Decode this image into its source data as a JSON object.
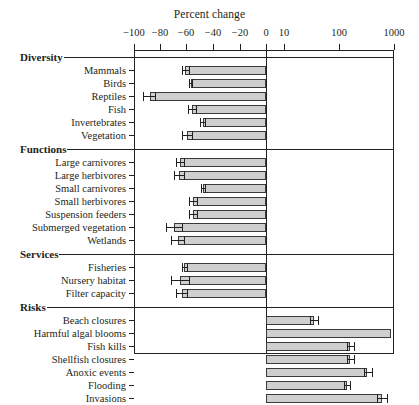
{
  "chart_data": {
    "type": "bar",
    "title": "Percent change",
    "xlabel": "Percent change",
    "ylabel": "",
    "orientation": "horizontal",
    "grid": false,
    "legend": null,
    "axis_note": "Asymmetric x-axis: linear from -100 to 0, logarithmic from 10 to 1000",
    "xticks": [
      {
        "label": "−100",
        "value": -100,
        "px": 134
      },
      {
        "label": "−80",
        "value": -80,
        "px": 160
      },
      {
        "label": "−60",
        "value": -60,
        "px": 186
      },
      {
        "label": "−40",
        "value": -40,
        "px": 213
      },
      {
        "label": "−20",
        "value": -20,
        "px": 240
      },
      {
        "label": "0",
        "value": 0,
        "px": 266
      },
      {
        "label": "10",
        "value": 10,
        "px": 284
      },
      {
        "label": "100",
        "value": 100,
        "px": 339
      },
      {
        "label": "1000",
        "value": 1000,
        "px": 394
      }
    ],
    "xlim": [
      -100,
      1000
    ],
    "sections": [
      {
        "name": "Diversity",
        "categories": [
          "Mammals",
          "Birds",
          "Reptiles",
          "Fish",
          "Invertebrates",
          "Vegetation"
        ],
        "values": [
          -61,
          -57,
          -88,
          -56,
          -48,
          -60
        ],
        "err_low": [
          -64,
          -58,
          -93,
          -59,
          -50,
          -64
        ],
        "err_high": [
          -58,
          -56,
          -84,
          -53,
          -46,
          -56
        ]
      },
      {
        "name": "Functions",
        "categories": [
          "Large carnivores",
          "Large herbivores",
          "Small carnivores",
          "Small herbivores",
          "Suspension feeders",
          "Submerged vegetation",
          "Wetlands"
        ],
        "values": [
          -65,
          -66,
          -48,
          -55,
          -55,
          -70,
          -67
        ],
        "err_low": [
          -68,
          -70,
          -49,
          -58,
          -58,
          -76,
          -72
        ],
        "err_high": [
          -62,
          -62,
          -46,
          -52,
          -52,
          -64,
          -62
        ]
      },
      {
        "name": "Services",
        "categories": [
          "Fisheries",
          "Nursery habitat",
          "Filter capacity"
        ],
        "values": [
          -62,
          -65,
          -64
        ],
        "err_low": [
          -64,
          -72,
          -68
        ],
        "err_high": [
          -60,
          -58,
          -60
        ]
      },
      {
        "name": "Risks",
        "categories": [
          "Beach closures",
          "Harmful algal blooms",
          "Fish kills",
          "Shellfish closures",
          "Anoxic events",
          "Flooding",
          "Invasions"
        ],
        "values": [
          35,
          900,
          160,
          160,
          320,
          140,
          600
        ],
        "err_low": [
          30,
          900,
          140,
          140,
          290,
          125,
          500
        ],
        "err_high": [
          42,
          900,
          190,
          190,
          400,
          160,
          760
        ]
      }
    ]
  },
  "axis": {
    "title": "Percent change"
  }
}
